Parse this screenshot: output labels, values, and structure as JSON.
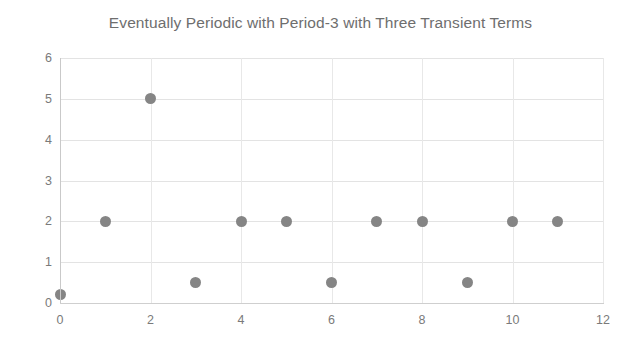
{
  "chart_data": {
    "type": "scatter",
    "title": "Eventually Periodic with Period-3 with Three Transient Terms",
    "xlabel": "",
    "ylabel": "",
    "x": [
      0,
      1,
      2,
      3,
      4,
      5,
      6,
      7,
      8,
      9,
      10,
      11
    ],
    "values": [
      0.2,
      2,
      5,
      0.5,
      2,
      2,
      0.5,
      2,
      2,
      0.5,
      2,
      2
    ],
    "series": [
      {
        "name": "sequence",
        "values": [
          0.2,
          2,
          5,
          0.5,
          2,
          2,
          0.5,
          2,
          2,
          0.5,
          2,
          2
        ]
      }
    ],
    "xlim": [
      0,
      12
    ],
    "ylim": [
      0,
      6
    ],
    "x_ticks": [
      0,
      2,
      4,
      6,
      8,
      10,
      12
    ],
    "y_ticks": [
      0,
      1,
      2,
      3,
      4,
      5,
      6
    ],
    "x_tick_labels": [
      "0",
      "2",
      "4",
      "6",
      "8",
      "10",
      "12"
    ],
    "y_tick_labels": [
      "0",
      "1",
      "2",
      "3",
      "4",
      "5",
      "6"
    ],
    "grid": true,
    "legend": false,
    "marker_color": "#858585",
    "grid_color": "#e3e3e3",
    "axis_color": "#c9c9c9",
    "text_color": "#7a7a7a",
    "title_color": "#6e6e6e",
    "background": "#ffffff"
  }
}
